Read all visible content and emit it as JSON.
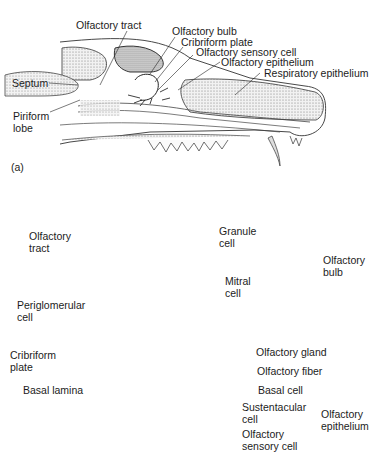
{
  "figure": {
    "panel_a": {
      "panel_label": "(a)",
      "labels": {
        "olfactory_tract": "Olfactory tract",
        "olfactory_bulb": "Olfactory bulb",
        "cribriform_plate": "Cribriform plate",
        "olfactory_sensory_cell": "Olfactory sensory cell",
        "olfactory_epithelium": "Olfactory epithelium",
        "respiratory_epithelium": "Respiratory epithelium",
        "septum": "Septum",
        "piriform_line1": "Piriform",
        "piriform_line2": "lobe"
      }
    },
    "panel_b": {
      "labels": {
        "olfactory_tract_line1": "Olfactory",
        "olfactory_tract_line2": "tract",
        "granule_line1": "Granule",
        "granule_line2": "cell",
        "mitral_line1": "Mitral",
        "mitral_line2": "cell",
        "periglomerular_line1": "Periglomerular",
        "periglomerular_line2": "cell",
        "olfactory_bulb_line1": "Olfactory",
        "olfactory_bulb_line2": "bulb",
        "cribriform_line1": "Cribriform",
        "cribriform_line2": "plate",
        "olfactory_gland": "Olfactory gland",
        "olfactory_fiber": "Olfactory fiber",
        "basal_lamina": "Basal lamina",
        "basal_cell": "Basal cell",
        "sustentacular_line1": "Sustentacular",
        "sustentacular_line2": "cell",
        "sensory_line1": "Olfactory",
        "sensory_line2": "sensory cell",
        "epithelium_line1": "Olfactory",
        "epithelium_line2": "epithelium"
      }
    },
    "colors": {
      "bulb_fill": "#ebeced",
      "line": "#2a2a2a",
      "stipple": "#8a8a8a"
    }
  }
}
